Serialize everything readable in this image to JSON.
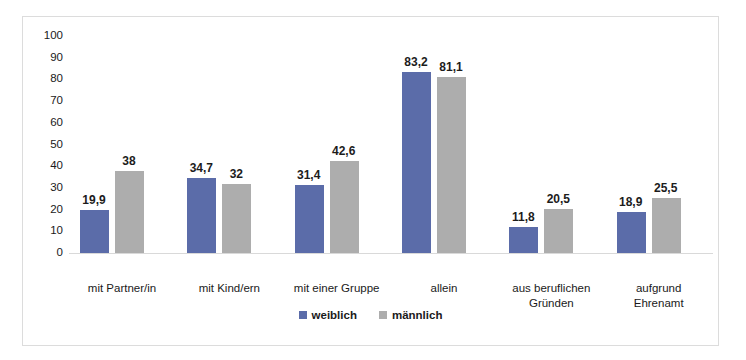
{
  "chart_data": {
    "type": "bar",
    "title": "",
    "xlabel": "",
    "ylabel": "",
    "ylim": [
      0,
      100
    ],
    "yticks": [
      "100",
      "90",
      "80",
      "70",
      "60",
      "50",
      "40",
      "30",
      "20",
      "10",
      "0"
    ],
    "grid": false,
    "legend_position": "bottom",
    "categories": [
      "mit Partner/in",
      "mit Kind/ern",
      "mit einer Gruppe",
      "allein",
      "aus beruflichen Gründen",
      "aufgrund Ehrenamt"
    ],
    "category_lines": [
      [
        "mit Partner/in"
      ],
      [
        "mit Kind/ern"
      ],
      [
        "mit einer Gruppe"
      ],
      [
        "allein"
      ],
      [
        "aus beruflichen",
        "Gründen"
      ],
      [
        "aufgrund",
        "Ehrenamt"
      ]
    ],
    "series": [
      {
        "name": "weiblich",
        "color": "#5b6ca9",
        "values": [
          19.9,
          34.7,
          31.4,
          83.2,
          11.8,
          18.9
        ],
        "labels": [
          "19,9",
          "34,7",
          "31,4",
          "83,2",
          "11,8",
          "18,9"
        ]
      },
      {
        "name": "männlich",
        "color": "#adadad",
        "values": [
          38,
          32,
          42.6,
          81.1,
          20.5,
          25.5
        ],
        "labels": [
          "38",
          "32",
          "42,6",
          "81,1",
          "20,5",
          "25,5"
        ]
      }
    ]
  },
  "legend": {
    "items": [
      {
        "label": "weiblich",
        "color": "#5b6ca9"
      },
      {
        "label": "männlich",
        "color": "#adadad"
      }
    ]
  }
}
